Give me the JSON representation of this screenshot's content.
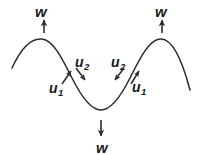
{
  "figure": {
    "type": "wave-vector-diagram",
    "background_color": "#ffffff",
    "stroke_color": "#2b2b2b",
    "text_color": "#1a1a1a",
    "curve": {
      "description": "sinusoidal wave with two crests and one trough",
      "path": "M 12 68 C 22 46, 32 38, 42 39 C 53 40, 62 58, 72 78 C 82 98, 92 110, 101 110 C 110 110, 120 98, 130 78 C 140 58, 149 40, 160 39 C 170 38, 180 52, 190 90",
      "left_crest": {
        "x": 42,
        "y": 39
      },
      "trough": {
        "x": 101,
        "y": 110
      },
      "right_crest": {
        "x": 160,
        "y": 39
      },
      "left_end": {
        "x": 12,
        "y": 68
      },
      "right_end": {
        "x": 190,
        "y": 90
      }
    },
    "arrows": {
      "w_left": {
        "label": "w",
        "direction": "up",
        "x1": 44,
        "y1": 33,
        "x2": 44,
        "y2": 20
      },
      "w_right": {
        "label": "w",
        "direction": "up",
        "x1": 162,
        "y1": 33,
        "x2": 162,
        "y2": 20
      },
      "w_bottom": {
        "label": "w",
        "direction": "down",
        "x1": 101,
        "y1": 120,
        "x2": 101,
        "y2": 136
      },
      "u1_left": {
        "label": "u",
        "subscript": "1",
        "direction": "up-right",
        "x1": 62,
        "y1": 84,
        "x2": 71,
        "y2": 71
      },
      "u2_left": {
        "label": "u",
        "subscript": "2",
        "direction": "down-right",
        "x1": 76,
        "y1": 68,
        "x2": 85,
        "y2": 80
      },
      "u2_right": {
        "label": "u",
        "subscript": "2",
        "direction": "down-left",
        "x1": 124,
        "y1": 68,
        "x2": 115,
        "y2": 80
      },
      "u1_right": {
        "label": "u",
        "subscript": "1",
        "direction": "up-right",
        "x1": 131,
        "y1": 84,
        "x2": 139,
        "y2": 71
      }
    },
    "labels": {
      "w_left": "w",
      "w_right": "w",
      "w_bottom": "w",
      "u1_left_base": "u",
      "u1_left_sub": "1",
      "u2_left_base": "u",
      "u2_left_sub": "2",
      "u2_right_base": "u",
      "u2_right_sub": "2",
      "u1_right_base": "u",
      "u1_right_sub": "1"
    }
  }
}
